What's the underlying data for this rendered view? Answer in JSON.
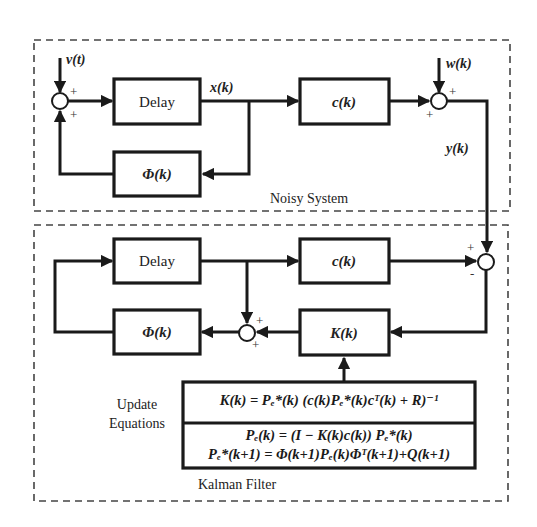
{
  "diagram": {
    "type": "block-diagram",
    "groups": [
      {
        "id": "noisy-system",
        "label": "Noisy System"
      },
      {
        "id": "kalman-filter",
        "label": "Kalman Filter"
      }
    ],
    "noisy_system": {
      "label": "Noisy System",
      "input_noise": "v(t)",
      "measurement_noise": "w(k)",
      "state": "x(k)",
      "output": "y(k)",
      "delay_block": "Delay",
      "phi_block": "Φ(k)",
      "c_block": "c(k)",
      "sum1_signs": [
        "+",
        "+"
      ],
      "sum2_signs": [
        "+",
        "+"
      ]
    },
    "kalman_filter": {
      "label": "Kalman Filter",
      "delay_block": "Delay",
      "phi_block": "Φ(k)",
      "c_block": "c(k)",
      "gain_block": "K(k)",
      "sum_error_signs": [
        "+",
        "-"
      ],
      "sum_update_signs": [
        "+",
        "+"
      ],
      "update_label_line1": "Update",
      "update_label_line2": "Equations",
      "equations": {
        "gain": "K(k) = Pₑ*(k) (c(k)Pₑ*(k)cᵀ(k) + R)⁻¹",
        "covariance_update": "Pₑ(k) = (I − K(k)c(k)) Pₑ*(k)",
        "covariance_predict": "Pₑ*(k+1) = Φ(k+1)Pₑ(k)Φᵀ(k+1)+Q(k+1)"
      }
    },
    "colors": {
      "line": "#1a1a1a",
      "dashed_border": "#444444",
      "background": "#ffffff"
    }
  }
}
